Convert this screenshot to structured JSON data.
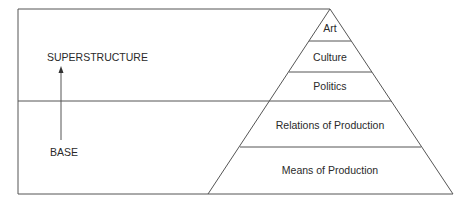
{
  "diagram": {
    "left_labels": {
      "top": "SUPERSTRUCTURE",
      "bottom": "BASE"
    },
    "arrow": {
      "direction": "up",
      "from": "BASE",
      "to": "SUPERSTRUCTURE"
    },
    "pyramid": {
      "tiers": [
        {
          "label": "Art",
          "group": "superstructure"
        },
        {
          "label": "Culture",
          "group": "superstructure"
        },
        {
          "label": "Politics",
          "group": "superstructure"
        },
        {
          "label": "Relations of Production",
          "group": "base"
        },
        {
          "label": "Means of Production",
          "group": "base"
        }
      ]
    },
    "colors": {
      "line": "#555555",
      "text": "#2a2a2a",
      "background": "#ffffff"
    }
  }
}
